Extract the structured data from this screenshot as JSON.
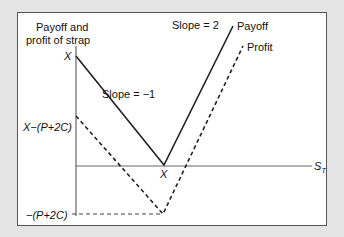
{
  "diagram": {
    "y_axis_label_line1": "Payoff and",
    "y_axis_label_line2": "profit of strap",
    "x_axis_label": "S",
    "x_axis_subscript": "T",
    "labels": {
      "x_top": "X",
      "x_minus_p2c": "X−(P+2C)",
      "neg_p2c": "−(P+2C)",
      "strike": "X",
      "slope_left": "Slope = −1",
      "slope_right": "Slope = 2",
      "payoff": "Payoff",
      "profit": "Profit"
    },
    "series": [
      {
        "name": "Payoff",
        "style": "solid",
        "points": [
          [
            76,
            56
          ],
          [
            164,
            165
          ],
          [
            233,
            26
          ]
        ]
      },
      {
        "name": "Profit",
        "style": "dashed",
        "points": [
          [
            76,
            116
          ],
          [
            163,
            214
          ],
          [
            243,
            46
          ]
        ]
      }
    ],
    "colors": {
      "background": "#e4e4e4",
      "panel": "#ffffff",
      "line": "#222222",
      "axis": "#666666"
    }
  }
}
